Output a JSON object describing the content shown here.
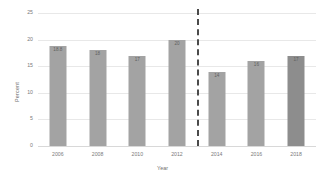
{
  "chart_data": {
    "type": "bar",
    "title": "",
    "xlabel": "Year",
    "ylabel": "Percent",
    "categories": [
      "2006",
      "2008",
      "2010",
      "2012",
      "2014",
      "2016",
      "2018"
    ],
    "values": [
      18.8,
      18,
      17,
      20,
      14,
      16,
      17
    ],
    "value_labels": [
      "18.8",
      "18",
      "17",
      "20",
      "14",
      "16",
      "17"
    ],
    "ylim": [
      0,
      25
    ],
    "yticks": [
      0,
      5,
      10,
      15,
      20,
      25
    ],
    "ytick_labels": [
      "0",
      "5",
      "10",
      "15",
      "20",
      "25"
    ],
    "grid": true,
    "legend": "none",
    "annotations": [
      {
        "type": "vertical-dashed-line",
        "between": [
          "2012",
          "2014"
        ],
        "style": "dashed",
        "color": "#4a4a4a"
      }
    ],
    "series": [
      {
        "name": "Percent",
        "values": [
          18.8,
          18,
          17,
          20,
          14,
          16,
          17
        ]
      }
    ],
    "colors": {
      "bar": "#a3a3a3",
      "bar_highlight": "#8d8d8d",
      "grid": "#e8e8e8",
      "axis_text": "#7a7a7a",
      "divider": "#4a4a4a",
      "background": "#ffffff"
    },
    "highlight_index": 6
  }
}
